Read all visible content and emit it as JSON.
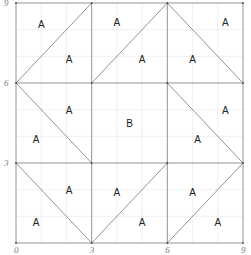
{
  "diagram": {
    "type": "tiling-grid",
    "axis": {
      "x_ticks": [
        "0",
        "3",
        "6",
        "9"
      ],
      "y_ticks": [
        "0",
        "3",
        "6",
        "9"
      ],
      "range": [
        0,
        9
      ]
    },
    "minor_grid_step": 1,
    "major_grid_step": 3,
    "diagonals": [
      {
        "from": [
          0,
          6
        ],
        "to": [
          3,
          9
        ]
      },
      {
        "from": [
          3,
          6
        ],
        "to": [
          6,
          9
        ]
      },
      {
        "from": [
          6,
          9
        ],
        "to": [
          9,
          6
        ]
      },
      {
        "from": [
          0,
          6
        ],
        "to": [
          3,
          3
        ]
      },
      {
        "from": [
          6,
          6
        ],
        "to": [
          9,
          3
        ]
      },
      {
        "from": [
          0,
          3
        ],
        "to": [
          3,
          0
        ]
      },
      {
        "from": [
          3,
          0
        ],
        "to": [
          6,
          3
        ]
      },
      {
        "from": [
          6,
          0
        ],
        "to": [
          9,
          3
        ]
      }
    ],
    "labels": [
      {
        "text": "A",
        "x": 1.0,
        "y": 8.2
      },
      {
        "text": "A",
        "x": 2.1,
        "y": 6.9
      },
      {
        "text": "A",
        "x": 4.0,
        "y": 8.3
      },
      {
        "text": "A",
        "x": 5.0,
        "y": 6.9
      },
      {
        "text": "A",
        "x": 8.3,
        "y": 8.3
      },
      {
        "text": "A",
        "x": 7.0,
        "y": 6.9
      },
      {
        "text": "A",
        "x": 2.1,
        "y": 5.0
      },
      {
        "text": "A",
        "x": 0.8,
        "y": 3.9
      },
      {
        "text": "B",
        "x": 4.5,
        "y": 4.5
      },
      {
        "text": "A",
        "x": 8.3,
        "y": 5.0
      },
      {
        "text": "A",
        "x": 7.2,
        "y": 3.9
      },
      {
        "text": "A",
        "x": 2.1,
        "y": 2.0
      },
      {
        "text": "A",
        "x": 0.8,
        "y": 0.8
      },
      {
        "text": "A",
        "x": 4.0,
        "y": 1.9
      },
      {
        "text": "A",
        "x": 5.0,
        "y": 0.8
      },
      {
        "text": "A",
        "x": 7.0,
        "y": 1.9
      },
      {
        "text": "A",
        "x": 8.0,
        "y": 0.8
      }
    ]
  }
}
